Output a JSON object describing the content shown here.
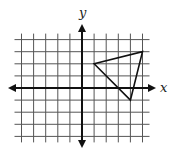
{
  "diagram": {
    "type": "coordinate-plane",
    "axes": {
      "x_label": "x",
      "y_label": "y",
      "x_range": [
        -5,
        5
      ],
      "y_range": [
        -4,
        4
      ],
      "grid_step": 1
    },
    "shape": {
      "kind": "triangle",
      "vertices": [
        [
          1,
          2
        ],
        [
          5,
          3
        ],
        [
          4,
          -1
        ]
      ]
    },
    "colors": {
      "grid": "#555555",
      "axis": "#111111",
      "shape": "#111111"
    }
  }
}
